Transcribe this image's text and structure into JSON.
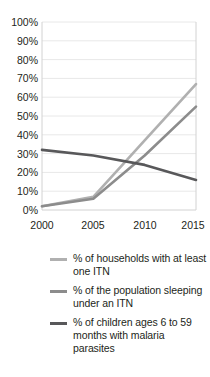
{
  "chart_data": {
    "type": "line",
    "title": "",
    "subtitle": "",
    "xlabel": "",
    "ylabel": "",
    "x": [
      2000,
      2005,
      2010,
      2015
    ],
    "xtick_labels": [
      "2000",
      "2005",
      "2010",
      "2015"
    ],
    "ytick_labels": [
      "0%",
      "10%",
      "20%",
      "30%",
      "40%",
      "50%",
      "60%",
      "70%",
      "80%",
      "90%",
      "100%"
    ],
    "ytick_values": [
      0,
      10,
      20,
      30,
      40,
      50,
      60,
      70,
      80,
      90,
      100
    ],
    "xlim": [
      2000,
      2015
    ],
    "ylim": [
      0,
      100
    ],
    "grid": "horizontal",
    "legend_position": "bottom",
    "series": [
      {
        "name": "% of households with at least one ITN",
        "values": [
          2,
          7,
          37,
          67
        ],
        "color": "#b0b0b0"
      },
      {
        "name": "% of the population sleeping under an ITN",
        "values": [
          2,
          6,
          29,
          55
        ],
        "color": "#8c8c8c"
      },
      {
        "name": "% of children ages 6 to 59 months with malaria parasites",
        "values": [
          32,
          29,
          24,
          16
        ],
        "color": "#58585a"
      }
    ]
  },
  "legend": {
    "items": [
      {
        "label": "% of households with at least one ITN",
        "color": "#b0b0b0"
      },
      {
        "label": "% of the population sleeping under an ITN",
        "color": "#8c8c8c"
      },
      {
        "label": "% of children ages 6 to 59 months with malaria parasites",
        "color": "#58585a"
      }
    ]
  },
  "axes": {
    "y_labels": [
      "100%",
      "90%",
      "80%",
      "70%",
      "60%",
      "50%",
      "40%",
      "30%",
      "20%",
      "10%",
      "0%"
    ],
    "x_labels": [
      "2000",
      "2005",
      "2010",
      "2015"
    ]
  }
}
